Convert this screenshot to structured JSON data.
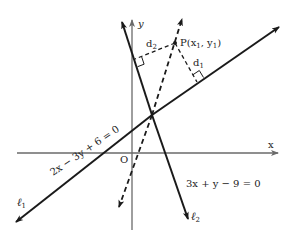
{
  "figure": {
    "type": "coordinate-geometry-diagram",
    "axes": {
      "x_label": "x",
      "y_label": "y",
      "origin_label": "O"
    },
    "lines": [
      {
        "id": "l1",
        "name_main": "ℓ",
        "name_sub": "1",
        "equation": "2x − 3y + 6 = 0",
        "style": "solid"
      },
      {
        "id": "l2",
        "name_main": "ℓ",
        "name_sub": "2",
        "equation": "3x + y − 9 = 0",
        "style": "solid"
      },
      {
        "id": "bisector",
        "style": "dashed"
      }
    ],
    "point": {
      "label_main": "P(x",
      "label_sub1": "1",
      "label_mid": ", y",
      "label_sub2": "1",
      "label_end": ")"
    },
    "distances": [
      {
        "main": "d",
        "sub": "1",
        "to": "l1"
      },
      {
        "main": "d",
        "sub": "2",
        "to": "l2"
      }
    ],
    "colors": {
      "line": "#1a1a1a",
      "axis": "#6a6a6a",
      "background": "#ffffff"
    }
  }
}
